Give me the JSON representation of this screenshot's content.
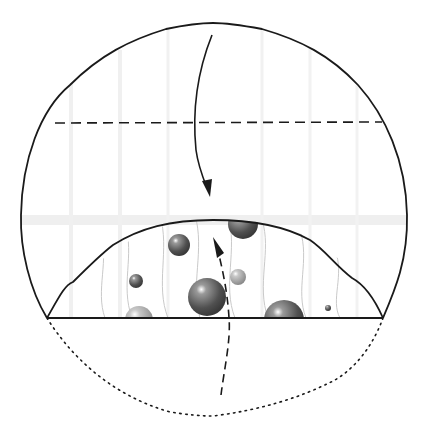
{
  "diagram": {
    "title": "Folding step: fold top edge down, bottom arc folded up",
    "background": "#ffffff",
    "line_color": "#1a1a1a",
    "bubble_color": "#5a5a5a",
    "shading_color": "#d8d8d8",
    "shapes": {
      "outer_circle": "solid outline of paper circle",
      "valley_fold_line": "dashed horizontal fold line",
      "bottom_edge": "solid horizontal edge",
      "hidden_flap": "dotted arc below bottom edge",
      "inner_arch": "solid arch of folded flap"
    },
    "arrows": [
      {
        "name": "fold-down-arrow",
        "style": "solid",
        "direction": "down"
      },
      {
        "name": "fold-up-arrow",
        "style": "dashed",
        "direction": "up"
      }
    ],
    "bubbles": [
      {
        "cx": 179,
        "cy": 245,
        "r": 11
      },
      {
        "cx": 136,
        "cy": 281,
        "r": 7
      },
      {
        "cx": 207,
        "cy": 297,
        "r": 19
      },
      {
        "cx": 238,
        "cy": 277,
        "r": 8
      },
      {
        "cx": 243,
        "cy": 224,
        "r": 15
      },
      {
        "cx": 284,
        "cy": 320,
        "r": 20
      },
      {
        "cx": 139,
        "cy": 320,
        "r": 14
      },
      {
        "cx": 328,
        "cy": 308,
        "r": 3
      }
    ]
  }
}
